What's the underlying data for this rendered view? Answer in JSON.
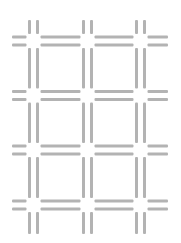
{
  "pattern": {
    "kind": "grid-of-double-line-crosses",
    "background": "#ffffff",
    "bar_color": "#b3b3b3",
    "columns_x": [
      33.5,
      87.5,
      140.5
    ],
    "rows_y": [
      41,
      95.5,
      150,
      205
    ],
    "bar_thickness": 3,
    "bar_pair_gap": 5,
    "center_gap": 7,
    "vertical_extent": [
      20,
      234
    ],
    "horizontal_extent": [
      12,
      168
    ]
  }
}
